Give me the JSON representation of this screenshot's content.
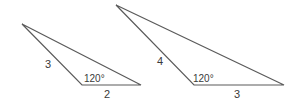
{
  "figure": {
    "triangles": [
      {
        "id": "small",
        "vertices": [
          [
            22,
            24
          ],
          [
            82,
            85
          ],
          [
            141,
            85
          ]
        ],
        "side_labels": [
          {
            "text": "3",
            "x": 45,
            "y": 68
          },
          {
            "text": "2",
            "x": 104,
            "y": 98
          }
        ],
        "angle_label": {
          "text": "120°",
          "x": 84,
          "y": 82
        }
      },
      {
        "id": "large",
        "vertices": [
          [
            116,
            5
          ],
          [
            194,
            85
          ],
          [
            284,
            85
          ]
        ],
        "side_labels": [
          {
            "text": "4",
            "x": 157,
            "y": 65
          },
          {
            "text": "3",
            "x": 234,
            "y": 98
          }
        ],
        "angle_label": {
          "text": "120°",
          "x": 193,
          "y": 82
        }
      }
    ],
    "colors": {
      "line": "#5a5a5a",
      "text": "#3a3a3a",
      "background": "#ffffff"
    }
  }
}
